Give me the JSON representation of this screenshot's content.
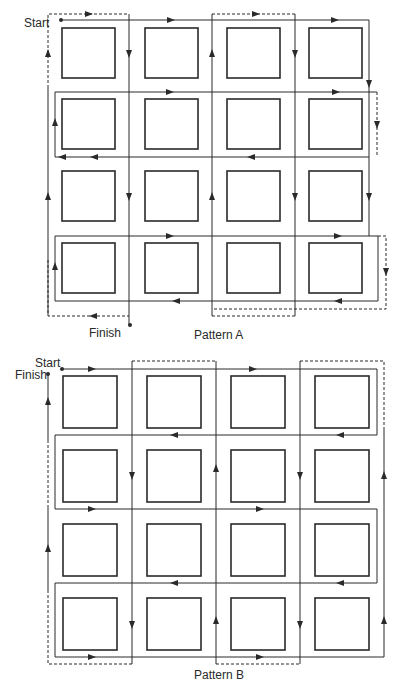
{
  "figure": {
    "type": "route-pattern-diagram",
    "colors": {
      "line": "#2a2a2a",
      "box": "#2a2a2a",
      "background": "#ffffff"
    }
  },
  "pattern_a": {
    "label": "Pattern A",
    "start_label": "Start",
    "finish_label": "Finish",
    "grid": {
      "rows": 4,
      "cols": 4
    }
  },
  "pattern_b": {
    "label": "Pattern B",
    "start_label": "Start",
    "finish_label": "Finish",
    "grid": {
      "rows": 4,
      "cols": 4
    }
  }
}
